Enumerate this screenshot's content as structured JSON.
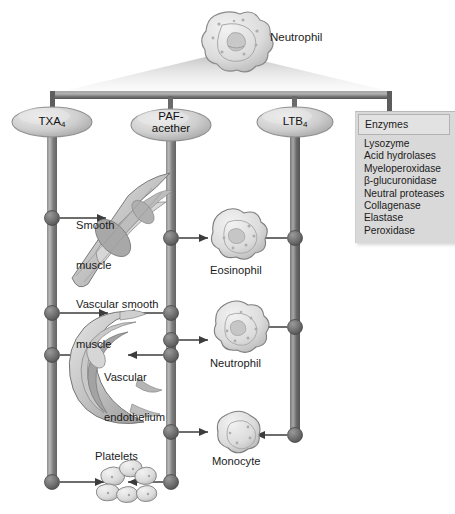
{
  "figure": {
    "background": "#ffffff",
    "accent_gray": "#6f6f6f",
    "box_fill": "#d9d9d9"
  },
  "source_cell": {
    "name": "neutrophil-source",
    "label": "Neutrophil",
    "icon": "neutrophil-cell-icon"
  },
  "mediators": [
    {
      "id": "txa4",
      "label": "TXA",
      "sub": "4",
      "label_full": "TXA4",
      "x": 52,
      "line_bottom": 482
    },
    {
      "id": "paf",
      "label": "PAF-",
      "sub": "",
      "label_full": "PAF-acether",
      "line2": "acether",
      "x": 171,
      "line_bottom": 482
    },
    {
      "id": "ltb4",
      "label": "LTB",
      "sub": "4",
      "label_full": "LTB4",
      "x": 295,
      "line_bottom": 435
    }
  ],
  "enzymes_panel": {
    "header": "Enzymes",
    "items": [
      "Lysozyme",
      "Acid hydrolases",
      "Myeloperoxidase",
      "β-glucuronidase",
      "Neutral proteases",
      "Collagenase",
      "Elastase",
      "Peroxidase"
    ]
  },
  "targets": [
    {
      "id": "smooth-muscle",
      "label": "Smooth\nmuscle",
      "label_line1": "Smooth",
      "label_line2": "muscle"
    },
    {
      "id": "vascular-smooth-muscle",
      "label": "Vascular smooth\nmuscle",
      "label_line1": "Vascular smooth",
      "label_line2": "muscle"
    },
    {
      "id": "vascular-endothelium",
      "label": "Vascular\nendothelium",
      "label_line1": "Vascular",
      "label_line2": "endothelium"
    },
    {
      "id": "platelets",
      "label": "Platelets",
      "label_line1": "Platelets",
      "label_line2": ""
    },
    {
      "id": "eosinophil",
      "label": "Eosinophil",
      "label_line1": "Eosinophil",
      "label_line2": ""
    },
    {
      "id": "neutrophil-target",
      "label": "Neutrophil",
      "label_line1": "Neutrophil",
      "label_line2": ""
    },
    {
      "id": "monocyte",
      "label": "Monocyte",
      "label_line1": "Monocyte",
      "label_line2": ""
    }
  ],
  "connections": [
    {
      "from": "txa4",
      "to": "smooth-muscle",
      "y": 218
    },
    {
      "from": "txa4",
      "to": "vascular-smooth-muscle",
      "y": 313
    },
    {
      "from": "txa4",
      "to": "vascular-endothelium",
      "y": 355
    },
    {
      "from": "txa4",
      "to": "platelets",
      "y": 482
    },
    {
      "from": "paf",
      "to": "vascular-smooth-muscle",
      "y": 313
    },
    {
      "from": "paf",
      "to": "eosinophil",
      "y": 238
    },
    {
      "from": "paf",
      "to": "neutrophil-target",
      "y": 340
    },
    {
      "from": "paf",
      "to": "monocyte",
      "y": 432
    },
    {
      "from": "paf",
      "to": "platelets",
      "y": 482
    },
    {
      "from": "ltb4",
      "to": "eosinophil",
      "y": 238
    },
    {
      "from": "ltb4",
      "to": "neutrophil-target",
      "y": 327
    },
    {
      "from": "ltb4",
      "to": "monocyte",
      "y": 435
    }
  ]
}
